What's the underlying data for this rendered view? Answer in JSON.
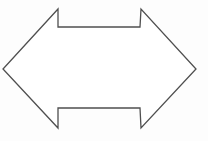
{
  "canvas": {
    "width": 208,
    "height": 141,
    "background_color": "#fdfdfd",
    "title": "Double-headed arrow outline"
  },
  "shape": {
    "name": "double-headed-arrow",
    "description": "Horizontal bidirectional arrow drawn as a thin outline",
    "fill_color": "#ffffff",
    "stroke_color": "#4f4f4f",
    "stroke_width": 1.3,
    "points": "58,9 58,27 140,27 141,9 196,69 141,128 140,108 58,108 58,128 3,69",
    "vertices": [
      {
        "label": "top-left-head-tip",
        "x": 58,
        "y": 9
      },
      {
        "label": "top-left-notch-corner",
        "x": 58,
        "y": 27
      },
      {
        "label": "top-right-notch-corner",
        "x": 140,
        "y": 27
      },
      {
        "label": "top-right-head-tip",
        "x": 141,
        "y": 9
      },
      {
        "label": "right-point",
        "x": 196,
        "y": 69
      },
      {
        "label": "bottom-right-head-tip",
        "x": 141,
        "y": 128
      },
      {
        "label": "bottom-right-notch-corner",
        "x": 140,
        "y": 108
      },
      {
        "label": "bottom-left-notch-corner",
        "x": 58,
        "y": 108
      },
      {
        "label": "bottom-left-head-tip",
        "x": 58,
        "y": 128
      },
      {
        "label": "left-point",
        "x": 3,
        "y": 69
      }
    ]
  }
}
